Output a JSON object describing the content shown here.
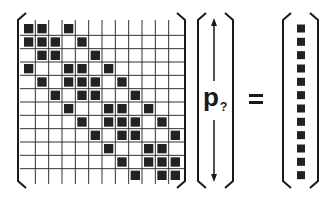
{
  "diagram": {
    "matrix": {
      "rows": 12,
      "cols": 12,
      "filled_cells": [
        [
          0,
          1,
          3
        ],
        [
          0,
          1,
          2,
          4
        ],
        [
          1,
          2,
          5
        ],
        [
          0,
          3,
          4,
          6
        ],
        [
          1,
          3,
          4,
          5,
          7
        ],
        [
          2,
          4,
          5,
          8
        ],
        [
          3,
          6,
          7,
          9
        ],
        [
          4,
          6,
          7,
          8,
          10
        ],
        [
          5,
          7,
          8,
          11
        ],
        [
          6,
          9,
          10
        ],
        [
          7,
          9,
          10,
          11
        ],
        [
          8,
          10,
          11
        ]
      ]
    },
    "unknown_vector": {
      "symbol": "p",
      "subscript": "?",
      "arrows": [
        "up",
        "down"
      ]
    },
    "operator": "=",
    "result_vector": {
      "length": 12,
      "filled": true
    },
    "colors": {
      "ink": "#1a1a1a",
      "grid": "#333333",
      "cell_fill": "#222222",
      "background": "#ffffff"
    }
  }
}
